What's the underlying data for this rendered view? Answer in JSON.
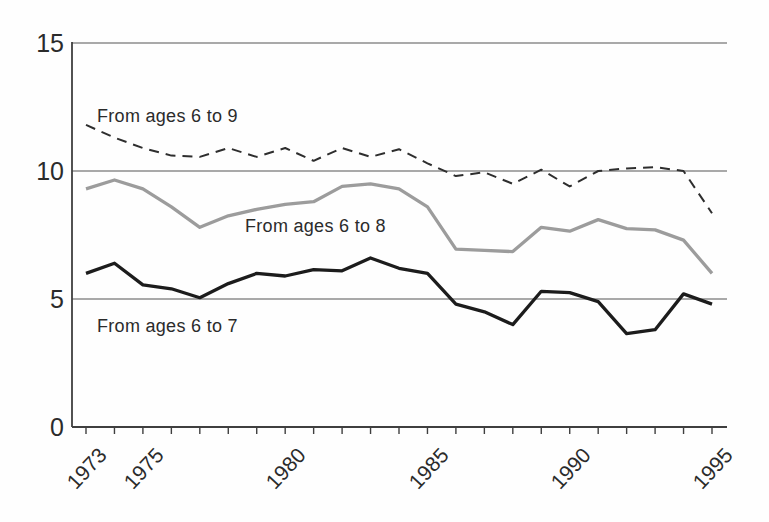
{
  "chart_data": {
    "type": "line",
    "title": "",
    "xlabel": "",
    "ylabel": "",
    "x": [
      1973,
      1974,
      1975,
      1976,
      1977,
      1978,
      1979,
      1980,
      1981,
      1982,
      1983,
      1984,
      1985,
      1986,
      1987,
      1988,
      1989,
      1990,
      1991,
      1992,
      1993,
      1994,
      1995
    ],
    "xlim": [
      1973,
      1995
    ],
    "ylim": [
      0,
      15
    ],
    "yticks": [
      0,
      5,
      10,
      15
    ],
    "grid": "horizontal gridlines at y = 5, 10, 15",
    "legend_position": "inline labels next to each line",
    "series": [
      {
        "id": "from-ages-6-to-9",
        "name": "From ages 6 to 9",
        "style": "dashed",
        "color": "#2e2e2e",
        "values": [
          11.8,
          11.3,
          10.9,
          10.6,
          10.55,
          10.9,
          10.55,
          10.9,
          10.4,
          10.9,
          10.55,
          10.85,
          10.3,
          9.8,
          9.95,
          9.5,
          10.05,
          9.4,
          10.0,
          10.1,
          10.15,
          10.0,
          8.35
        ]
      },
      {
        "id": "from-ages-6-to-8",
        "name": "From ages 6 to 8",
        "style": "solid",
        "color": "#9c9c9c",
        "values": [
          9.3,
          9.65,
          9.3,
          8.6,
          7.8,
          8.25,
          8.5,
          8.7,
          8.8,
          9.4,
          9.5,
          9.3,
          8.6,
          6.95,
          6.9,
          6.85,
          7.8,
          7.65,
          8.1,
          7.75,
          7.7,
          7.3,
          6.0
        ]
      },
      {
        "id": "from-ages-6-to-7",
        "name": "From ages 6 to 7",
        "style": "solid",
        "color": "#1c1c1c",
        "values": [
          6.0,
          6.4,
          5.55,
          5.4,
          5.05,
          5.6,
          6.0,
          5.9,
          6.15,
          6.1,
          6.6,
          6.2,
          6.0,
          4.8,
          4.5,
          4.0,
          5.3,
          5.25,
          4.9,
          3.65,
          3.8,
          5.2,
          4.8
        ]
      }
    ]
  },
  "y_axis": {
    "tick_labels": [
      "15",
      "10",
      "5",
      "0"
    ]
  },
  "x_axis": {
    "tick_labels": [
      "1973",
      "1975",
      "1980",
      "1985",
      "1990",
      "1995"
    ],
    "labeled_years": [
      1973,
      1975,
      1980,
      1985,
      1990,
      1995
    ]
  },
  "axis_colors": {
    "axis": "#3f3f3f",
    "gridline": "#8c8c8c"
  }
}
